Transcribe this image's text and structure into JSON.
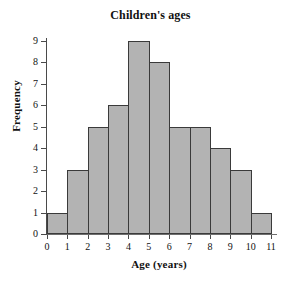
{
  "chart_data": {
    "type": "bar",
    "title": "Children's ages",
    "xlabel": "Age (years)",
    "ylabel": "Frequency",
    "categories": [
      "0-1",
      "1-2",
      "2-3",
      "3-4",
      "4-5",
      "5-6",
      "6-7",
      "7-8",
      "8-9",
      "9-10",
      "10-11"
    ],
    "bin_edges": [
      0,
      1,
      2,
      3,
      4,
      5,
      6,
      7,
      8,
      9,
      10,
      11
    ],
    "values": [
      1,
      3,
      5,
      6,
      9,
      8,
      5,
      5,
      4,
      3,
      1
    ],
    "xtick_labels": [
      "0",
      "1",
      "2",
      "3",
      "4",
      "5",
      "6",
      "7",
      "8",
      "9",
      "10",
      "11"
    ],
    "ytick_labels": [
      "0",
      "1",
      "2",
      "3",
      "4",
      "5",
      "6",
      "7",
      "8",
      "9"
    ],
    "xlim": [
      0,
      11
    ],
    "ylim": [
      0,
      9
    ],
    "grid": false,
    "legend": null,
    "colors": {
      "bar_fill": "#b3b3b3",
      "bar_border": "#3a3a3a",
      "axis": "#4a4a4a",
      "text": "#111111",
      "background": "#ffffff"
    }
  }
}
